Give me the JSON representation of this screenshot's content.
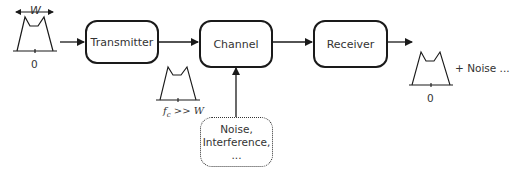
{
  "blocks": {
    "transmitter": "Transmitter",
    "channel": "Channel",
    "receiver": "Receiver"
  },
  "noise_source": {
    "lines": [
      "Noise,",
      "Interference,",
      "..."
    ]
  },
  "spectra": {
    "input": {
      "width_label": "W",
      "center_label": "0"
    },
    "transmitted": {
      "label_f": "f",
      "label_sub": "c",
      "label_rest": " >> W"
    },
    "output": {
      "center_label": "0",
      "suffix": "+ Noise ..."
    }
  },
  "colors": {
    "stroke": "#1a1a1a",
    "text": "#333333"
  }
}
